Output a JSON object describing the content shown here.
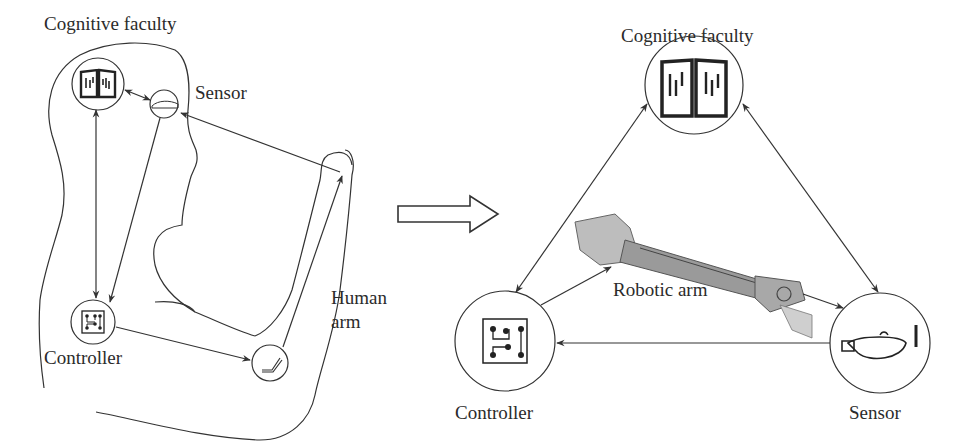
{
  "figure": {
    "left_panel": {
      "title": "Cognitive faculty",
      "nodes": {
        "cognitive": {
          "icon": "open-book-icon"
        },
        "sensor": {
          "label": "Sensor",
          "icon": "oil-lamp-icon"
        },
        "controller": {
          "label": "Controller",
          "icon": "circuit-board-icon"
        },
        "effector": {
          "icon": "bent-arm-icon"
        }
      },
      "arm_label_line1": "Human",
      "arm_label_line2": "arm"
    },
    "transition_arrow": {
      "icon": "hollow-right-arrow-icon"
    },
    "right_panel": {
      "nodes": {
        "cognitive": {
          "label": "Cognitive faculty",
          "icon": "open-book-icon"
        },
        "controller": {
          "label": "Controller",
          "icon": "circuit-board-icon"
        },
        "sensor": {
          "label": "Sensor",
          "icon": "oil-lamp-icon"
        },
        "robot": {
          "label": "Robotic arm",
          "icon": "robotic-arm-icon"
        }
      }
    },
    "colors": {
      "ink": "#333333",
      "background": "#ffffff",
      "robot_shade": "#9a9a9a"
    }
  }
}
